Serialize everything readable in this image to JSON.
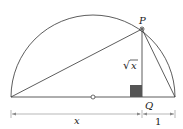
{
  "diagram": {
    "labels": {
      "point_p": "P",
      "point_q": "Q",
      "sqrt_symbol": "√",
      "sqrt_var": "x",
      "segment_x": "x",
      "segment_one": "1"
    },
    "colors": {
      "stroke": "#333333",
      "right_angle_fill": "#555555",
      "dimension_line": "#888888"
    }
  }
}
